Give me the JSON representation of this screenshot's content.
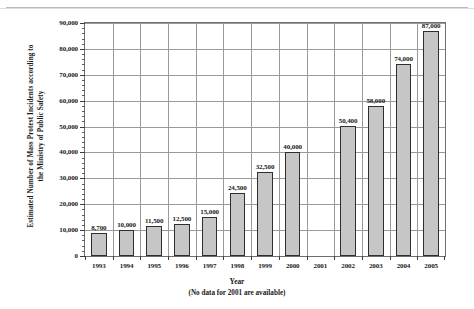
{
  "chart_data": {
    "type": "bar",
    "title": "",
    "subtitle": "",
    "xlabel": "Year",
    "ylabel": "Estimated Number of Mass Protest Incidents according to the Ministry of Public Safety",
    "ylabel_line1": "Estimated Number of Mass Protest Incidents according to",
    "ylabel_line2": "the Ministry of Public Safety",
    "footnote": "(No data for 2001 are available)",
    "categories": [
      "1993",
      "1994",
      "1995",
      "1996",
      "1997",
      "1998",
      "1999",
      "2000",
      "2001",
      "2002",
      "2003",
      "2004",
      "2005"
    ],
    "values": [
      8700,
      10000,
      11500,
      12500,
      15000,
      24500,
      32500,
      40000,
      null,
      50400,
      58000,
      74000,
      87000
    ],
    "value_labels": [
      "8,700",
      "10,000",
      "11,500",
      "12,500",
      "15,000",
      "24,500",
      "32,500",
      "40,000",
      "",
      "50,400",
      "58,000",
      "74,000",
      "87,000"
    ],
    "ylim": [
      0,
      90000
    ],
    "ytick_values": [
      0,
      10000,
      20000,
      30000,
      40000,
      50000,
      60000,
      70000,
      80000,
      90000
    ],
    "ytick_labels": [
      "0",
      "10,000",
      "20,000",
      "30,000",
      "40,000",
      "50,000",
      "60,000",
      "70,000",
      "80,000",
      "90,000"
    ],
    "ytick_minor_step": 2000,
    "grid": "both",
    "legend": "none",
    "bar_color": "#c6c6c6",
    "bar_edge_color": "#2e2e2e",
    "grid_color": "#9a9a9a",
    "axis_color": "#6f6f6f",
    "text_color": "#1a1a1a"
  }
}
